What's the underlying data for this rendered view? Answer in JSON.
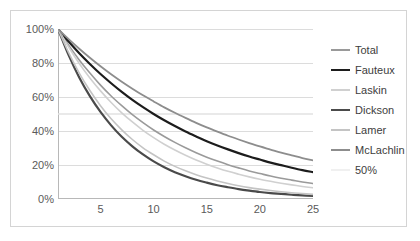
{
  "chart_data": {
    "type": "line",
    "title": "",
    "subtitle": "",
    "xlabel": "",
    "ylabel": "",
    "xlim": [
      1,
      25
    ],
    "ylim": [
      0,
      1
    ],
    "grid": true,
    "legend_position": "right",
    "x_ticks": [
      5,
      10,
      15,
      20,
      25
    ],
    "x_minor_ticks": true,
    "y_ticks": [
      0,
      0.2,
      0.4,
      0.6,
      0.8,
      1.0
    ],
    "y_tick_labels": [
      "0%",
      "20%",
      "40%",
      "60%",
      "80%",
      "100%"
    ],
    "x": [
      1,
      2,
      3,
      4,
      5,
      6,
      7,
      8,
      9,
      10,
      11,
      12,
      13,
      14,
      15,
      16,
      17,
      18,
      19,
      20,
      21,
      22,
      23,
      24,
      25
    ],
    "series": [
      {
        "name": "Total",
        "color": "#9a9a9a",
        "width": 1.6,
        "values": [
          1.0,
          0.905,
          0.818,
          0.741,
          0.67,
          0.606,
          0.549,
          0.496,
          0.449,
          0.406,
          0.368,
          0.333,
          0.301,
          0.272,
          0.246,
          0.223,
          0.202,
          0.183,
          0.165,
          0.15,
          0.135,
          0.122,
          0.111,
          0.1,
          0.091
        ]
      },
      {
        "name": "Fauteux",
        "color": "#1c1c1c",
        "width": 2.2,
        "values": [
          1.0,
          0.926,
          0.857,
          0.794,
          0.735,
          0.681,
          0.63,
          0.583,
          0.54,
          0.5,
          0.463,
          0.429,
          0.397,
          0.368,
          0.34,
          0.315,
          0.292,
          0.27,
          0.25,
          0.232,
          0.214,
          0.199,
          0.184,
          0.17,
          0.158
        ]
      },
      {
        "name": "Laskin",
        "color": "#d0d0d0",
        "width": 1.6,
        "values": [
          1.0,
          0.893,
          0.797,
          0.712,
          0.636,
          0.568,
          0.507,
          0.453,
          0.404,
          0.361,
          0.322,
          0.288,
          0.257,
          0.229,
          0.205,
          0.183,
          0.163,
          0.146,
          0.13,
          0.116,
          0.104,
          0.093,
          0.083,
          0.074,
          0.066
        ]
      },
      {
        "name": "Dickson",
        "color": "#4a4a4a",
        "width": 2.2,
        "values": [
          1.0,
          0.846,
          0.715,
          0.605,
          0.512,
          0.433,
          0.366,
          0.31,
          0.262,
          0.221,
          0.187,
          0.158,
          0.134,
          0.113,
          0.096,
          0.081,
          0.069,
          0.058,
          0.049,
          0.041,
          0.035,
          0.03,
          0.025,
          0.021,
          0.018
        ]
      },
      {
        "name": "Lamer",
        "color": "#c4c4c4",
        "width": 1.6,
        "values": [
          1.0,
          0.861,
          0.741,
          0.638,
          0.549,
          0.472,
          0.407,
          0.35,
          0.301,
          0.26,
          0.223,
          0.192,
          0.166,
          0.143,
          0.123,
          0.106,
          0.091,
          0.078,
          0.067,
          0.058,
          0.05,
          0.043,
          0.037,
          0.032,
          0.027
        ]
      },
      {
        "name": "McLachlin",
        "color": "#8d8d8d",
        "width": 1.8,
        "values": [
          1.0,
          0.94,
          0.884,
          0.831,
          0.781,
          0.734,
          0.69,
          0.649,
          0.61,
          0.574,
          0.539,
          0.507,
          0.477,
          0.448,
          0.421,
          0.396,
          0.372,
          0.35,
          0.329,
          0.309,
          0.291,
          0.273,
          0.257,
          0.241,
          0.227
        ]
      },
      {
        "name": "50%",
        "color": "#e2e2e2",
        "width": 1.4,
        "values": [
          0.5,
          0.5,
          0.5,
          0.5,
          0.5,
          0.5,
          0.5,
          0.5,
          0.5,
          0.5,
          0.5,
          0.5,
          0.5,
          0.5,
          0.5,
          0.5,
          0.5,
          0.5,
          0.5,
          0.5,
          0.5,
          0.5,
          0.5,
          0.5,
          0.5
        ]
      }
    ]
  },
  "legend": {
    "items": [
      {
        "label": "Total"
      },
      {
        "label": "Fauteux"
      },
      {
        "label": "Laskin"
      },
      {
        "label": "Dickson"
      },
      {
        "label": "Lamer"
      },
      {
        "label": "McLachlin"
      },
      {
        "label": "50%"
      }
    ]
  },
  "style": {
    "grid_color": "#dcdcdc",
    "axis_color": "#b8b8b8",
    "frame_color": "#d4d4d4",
    "tick_text_color": "#5a5a5a",
    "legend_text_color": "#3d3d3d",
    "background": "#ffffff"
  }
}
